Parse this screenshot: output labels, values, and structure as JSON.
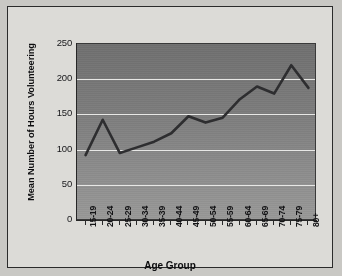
{
  "chart_data": {
    "type": "line",
    "title": "",
    "xlabel": "Age Group",
    "ylabel": "Mean Number of Hours Volunteering",
    "categories": [
      "15-19",
      "20-24",
      "25-29",
      "30-34",
      "35-39",
      "40-44",
      "45-49",
      "50-54",
      "55-59",
      "60-64",
      "65-69",
      "70-74",
      "75-79",
      "80+"
    ],
    "values": [
      93,
      143,
      96,
      104,
      112,
      124,
      148,
      139,
      146,
      172,
      190,
      180,
      220,
      188
    ],
    "series": [
      {
        "name": "Mean Number of Hours Volunteering",
        "values": [
          93,
          143,
          96,
          104,
          112,
          124,
          148,
          139,
          146,
          172,
          190,
          180,
          220,
          188
        ]
      }
    ],
    "ylim": [
      0,
      250
    ],
    "yticks": [
      0,
      50,
      100,
      150,
      200,
      250
    ],
    "ytick_labels": [
      "0",
      "50",
      "100",
      "150",
      "200",
      "250"
    ],
    "grid": true,
    "legend": false,
    "legend_position": "none",
    "line_color": "#2d2d2f",
    "plot_background": "#7d7d7d",
    "gridline_color": "#e8e8e6",
    "page_background": "#c9c8c4",
    "panel_background": "#dcdbd7"
  }
}
